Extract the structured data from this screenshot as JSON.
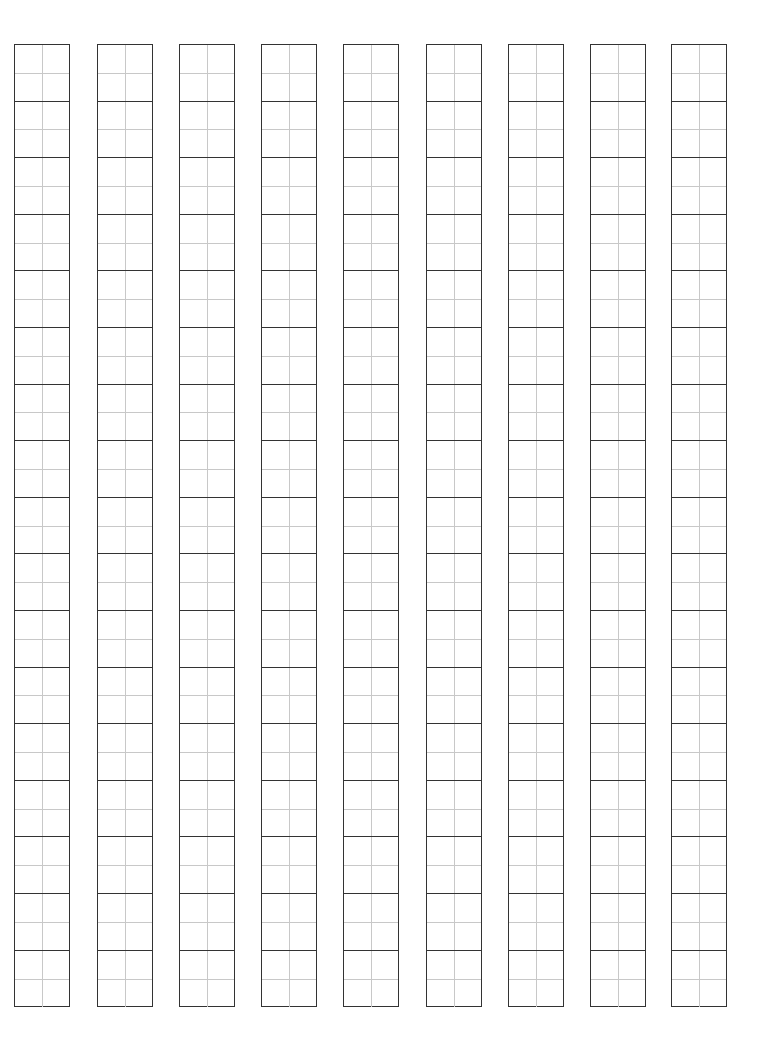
{
  "sheet": {
    "type": "writing-practice-grid",
    "columns": 9,
    "cells_per_column": 17,
    "column_left_positions": [
      14,
      97,
      179,
      261,
      343,
      426,
      508,
      590,
      671
    ],
    "colors": {
      "border": "#333333",
      "guide": "#c8c8c8",
      "background": "#ffffff"
    }
  }
}
